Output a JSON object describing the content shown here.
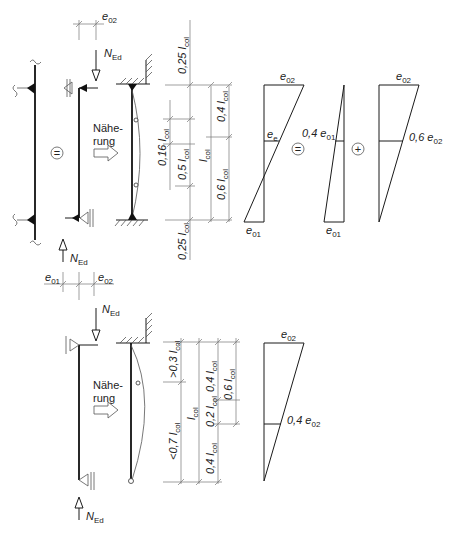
{
  "labels": {
    "e02": "e",
    "e02_sub": "02",
    "e01": "e",
    "e01_sub": "01",
    "ee": "e",
    "ee_sub": "e",
    "N": "N",
    "N_sub": "Ed",
    "naeherung_1": "Nähe-",
    "naeherung_2": "rung",
    "equals": "=",
    "plus": "+"
  },
  "top_case": {
    "dimensions_left": [
      "0,25 l",
      "0,16 l",
      "0,5 l",
      "0,25 l"
    ],
    "dimensions_mid": [
      "l"
    ],
    "dimensions_right": [
      "0,4 l",
      "0,6 l"
    ],
    "dim_sub": "col",
    "diagram_labels": {
      "first_top": "e02",
      "first_mid": "ee",
      "first_bottom": "e01",
      "second_mid": "0,4 e01",
      "second_bottom": "e01",
      "third_top": "e02",
      "third_mid": "0,6 e02"
    },
    "second_mid_text": "0,4 e",
    "second_mid_sub": "01",
    "third_mid_text": "0,6 e",
    "third_mid_sub": "02"
  },
  "bottom_case": {
    "dimensions_left": [
      ">0,3 l",
      "<0,7 l"
    ],
    "dimensions_mid": [
      "l",
      "0,2 l"
    ],
    "dimensions_right": [
      "0,4 l",
      "0,4 l",
      "0,6 l"
    ],
    "dim_sub": "col",
    "diagram_labels": {
      "top": "e02",
      "mid": "0,4 e02"
    },
    "mid_text": "0,4 e",
    "mid_sub": "02"
  },
  "dim_texts": {
    "t025": "0,25 l",
    "t016": "0,16 l",
    "t05": "0,5 l",
    "t04": "0,4 l",
    "t06": "0,6 l",
    "tl": "l",
    "t03": ">0,3 l",
    "t07": "<0,7 l",
    "t02": "0,2 l",
    "col": "col"
  }
}
